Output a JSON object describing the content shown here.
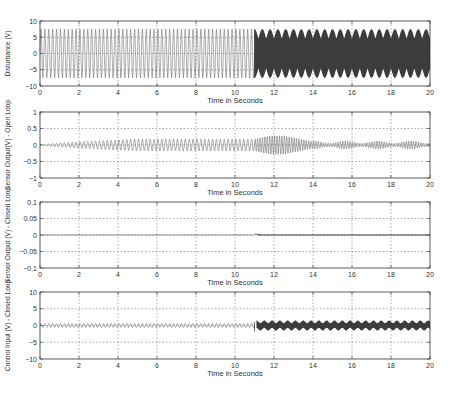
{
  "figure": {
    "colors": {
      "axis": "#333333",
      "grid": "#555555",
      "trace": "#4a4a4a",
      "trace_dense": "#3c3c3c",
      "background": "#ffffff"
    }
  },
  "chart_data": [
    {
      "type": "line",
      "title": "",
      "xlabel": "Time in Seconds",
      "ylabel": "Disturbance (V)",
      "xlim": [
        0,
        20
      ],
      "ylim": [
        -10,
        10
      ],
      "xticks": [
        0,
        2,
        4,
        6,
        8,
        10,
        12,
        14,
        16,
        18,
        20
      ],
      "yticks": [
        10,
        5,
        0,
        -5,
        -10
      ],
      "grid": true,
      "series": [
        {
          "name": "disturbance",
          "segments": [
            {
              "t": [
                0,
                11
              ],
              "shape": "sinusoid",
              "amplitude": 7.5,
              "cycles_per_s": 5
            },
            {
              "t": [
                11,
                20
              ],
              "shape": "beating high-frequency carrier",
              "envelope_max": 7.5,
              "envelope_min": 4.5,
              "envelope_cycles_per_s": 2.5
            }
          ]
        }
      ]
    },
    {
      "type": "line",
      "xlabel": "Time in Seconds",
      "ylabel": "Sensor Output(V) - Open Loop",
      "xlim": [
        0,
        20
      ],
      "ylim": [
        -1,
        1
      ],
      "xticks": [
        0,
        2,
        4,
        6,
        8,
        10,
        12,
        14,
        16,
        18,
        20
      ],
      "yticks": [
        1,
        0.5,
        0,
        -0.5,
        -1
      ],
      "grid": true,
      "series": [
        {
          "name": "sensor_open_loop",
          "segments": [
            {
              "t": [
                0,
                2
              ],
              "shape": "growing oscillation",
              "amplitude_start": 0.02,
              "amplitude_end": 0.1
            },
            {
              "t": [
                2,
                11
              ],
              "shape": "oscillation",
              "amplitude": 0.18
            },
            {
              "t": [
                11,
                12.5
              ],
              "shape": "dense oscillation",
              "amplitude": 0.28
            },
            {
              "t": [
                12.5,
                14
              ],
              "shape": "decaying oscillation",
              "amplitude_start": 0.28,
              "amplitude_end": 0.1
            },
            {
              "t": [
                14,
                20
              ],
              "shape": "beating oscillation",
              "amplitude_max": 0.12,
              "amplitude_min": 0.05
            }
          ]
        }
      ]
    },
    {
      "type": "line",
      "xlabel": "Time in Seconds",
      "ylabel": "Sensor Output (V) - Closed Loop",
      "xlim": [
        0,
        20
      ],
      "ylim": [
        -0.1,
        0.1
      ],
      "xticks": [
        0,
        2,
        4,
        6,
        8,
        10,
        12,
        14,
        16,
        18,
        20
      ],
      "yticks": [
        0.1,
        0.05,
        0,
        -0.05,
        -0.1
      ],
      "grid": true,
      "series": [
        {
          "name": "sensor_closed_loop",
          "segments": [
            {
              "t": [
                0,
                0.3
              ],
              "shape": "small transient",
              "amplitude": 0.002
            },
            {
              "t": [
                0.3,
                11
              ],
              "shape": "near zero",
              "amplitude": 0.0
            },
            {
              "t": [
                11,
                11.3
              ],
              "shape": "small spike",
              "amplitude": 0.003
            },
            {
              "t": [
                11.3,
                20
              ],
              "shape": "thin band",
              "amplitude": 0.002
            }
          ]
        }
      ]
    },
    {
      "type": "line",
      "xlabel": "Time in Seconds",
      "ylabel": "Control Input (V) - Closed Loop",
      "xlim": [
        0,
        20
      ],
      "ylim": [
        -10,
        10
      ],
      "xticks": [
        0,
        2,
        4,
        6,
        8,
        10,
        12,
        14,
        16,
        18,
        20
      ],
      "yticks": [
        10,
        5,
        0,
        -5,
        -10
      ],
      "grid": true,
      "series": [
        {
          "name": "control_input",
          "segments": [
            {
              "t": [
                0,
                11
              ],
              "shape": "small oscillation",
              "amplitude": 0.6,
              "cycles_per_s": 5
            },
            {
              "t": [
                11,
                11.2
              ],
              "shape": "step transient",
              "min": -1.8
            },
            {
              "t": [
                11.2,
                20
              ],
              "shape": "beating band",
              "amplitude_max": 1.5,
              "amplitude_min": 0.8,
              "envelope_cycles_per_s": 2.5
            }
          ]
        }
      ]
    }
  ]
}
